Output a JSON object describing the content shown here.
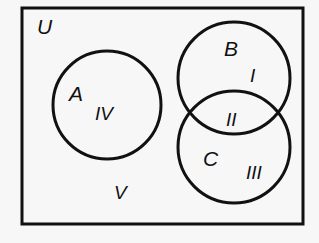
{
  "diagram": {
    "type": "venn",
    "universe_label": "U",
    "sets": [
      {
        "name": "A",
        "region_label": "IV"
      },
      {
        "name": "B",
        "region_label": "I"
      },
      {
        "name": "C",
        "region_label": "III"
      }
    ],
    "intersection_B_C_label": "II",
    "outside_label": "V",
    "colors": {
      "stroke": "#111111",
      "background": "#f7f7f7"
    }
  }
}
